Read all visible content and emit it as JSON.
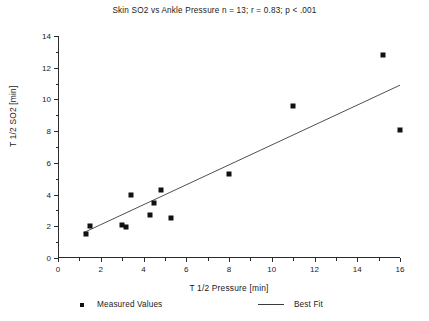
{
  "chart_data": {
    "type": "scatter",
    "title": "Skin SO2 vs Ankle Pressure n = 13; r = 0.83; p < .001",
    "xlabel": "T 1/2 Pressure [min]",
    "ylabel": "T 1/2 SO2 [min]",
    "xlim": [
      0,
      16
    ],
    "ylim": [
      0,
      14
    ],
    "xticks": [
      0,
      2,
      4,
      6,
      8,
      10,
      12,
      14,
      16
    ],
    "xticklabels": [
      "0",
      "2",
      "4",
      "6",
      "8",
      "10",
      "12",
      "14",
      "16"
    ],
    "xminorticks": [
      1,
      3,
      5,
      7,
      9,
      11,
      13,
      15
    ],
    "yticks": [
      0,
      2,
      4,
      6,
      8,
      10,
      12,
      14
    ],
    "yticklabels": [
      "0",
      "2",
      "4",
      "6",
      "8",
      "10",
      "12",
      "14"
    ],
    "yminorticks": [
      1,
      3,
      5,
      7,
      9,
      11,
      13
    ],
    "grid": false,
    "legend_position": "below-axes",
    "n": 13,
    "r": 0.83,
    "p_text": "p < .001",
    "series": [
      {
        "name": "Measured Values",
        "type": "scatter",
        "marker": "square",
        "color": "#111111",
        "points": [
          {
            "x": 1.3,
            "y": 1.5
          },
          {
            "x": 1.5,
            "y": 2.0
          },
          {
            "x": 3.0,
            "y": 2.1
          },
          {
            "x": 3.2,
            "y": 1.95
          },
          {
            "x": 3.4,
            "y": 4.0
          },
          {
            "x": 4.3,
            "y": 2.7
          },
          {
            "x": 4.5,
            "y": 3.5
          },
          {
            "x": 4.8,
            "y": 4.3
          },
          {
            "x": 5.3,
            "y": 2.5
          },
          {
            "x": 8.0,
            "y": 5.3
          },
          {
            "x": 11.0,
            "y": 9.6
          },
          {
            "x": 15.2,
            "y": 12.8
          },
          {
            "x": 16.0,
            "y": 8.1
          }
        ]
      },
      {
        "name": "Best Fit",
        "type": "line",
        "color": "#3b3b3b",
        "endpoints": [
          {
            "x": 1.2,
            "y": 1.6
          },
          {
            "x": 16.0,
            "y": 10.9
          }
        ]
      }
    ]
  },
  "legend": {
    "measured_label": "Measured Values",
    "bestfit_label": "Best Fit"
  }
}
